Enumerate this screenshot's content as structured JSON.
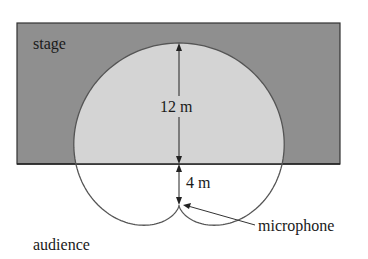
{
  "diagram": {
    "type": "cardioid microphone pickup pattern",
    "labels": {
      "stage": "stage",
      "audience": "audience",
      "microphone": "microphone",
      "dim_upper": "12 m",
      "dim_lower": "4 m"
    },
    "colors": {
      "stage_fill": "#8f8f8f",
      "pattern_fill": "#d4d4d4",
      "outline": "#555555",
      "text": "#1a1a1a"
    },
    "measurements": {
      "mic_to_stage_edge_m": 4,
      "stage_edge_to_pattern_top_m": 12
    }
  }
}
